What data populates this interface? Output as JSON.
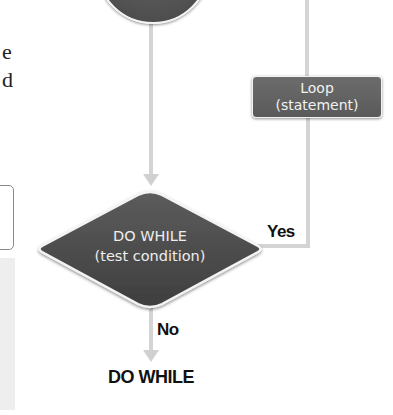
{
  "page_fragment": {
    "text_lines": [
      "e",
      "d"
    ]
  },
  "flowchart": {
    "start_node": {
      "shape": "circle",
      "label": ""
    },
    "loop_node": {
      "line1": "Loop",
      "line2": "(statement)"
    },
    "decision_node": {
      "line1": "DO WHILE",
      "line2": "(test condition)"
    },
    "edges": {
      "yes_label": "Yes",
      "no_label": "No"
    },
    "caption": "DO WHILE"
  },
  "colors": {
    "node_fill": "#5a5a5a",
    "node_text": "#f2f2f2",
    "connector": "#d4d4d4",
    "label_text": "#111111"
  }
}
